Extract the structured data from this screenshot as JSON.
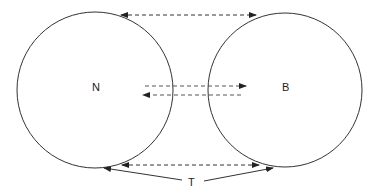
{
  "diagram": {
    "nodes": [
      {
        "id": "N",
        "label": "N",
        "cx": 95,
        "cy": 90,
        "r": 78
      },
      {
        "id": "B",
        "label": "B",
        "cx": 285,
        "cy": 90,
        "r": 77
      }
    ],
    "annotation": {
      "label": "T"
    },
    "arrows": [
      {
        "type": "dashed-bidirectional",
        "position": "top"
      },
      {
        "type": "dashed",
        "direction": "N-to-B",
        "position": "middle-upper"
      },
      {
        "type": "dashed",
        "direction": "B-to-N",
        "position": "middle-lower"
      },
      {
        "type": "dashed-bidirectional",
        "position": "bottom"
      },
      {
        "type": "solid",
        "from": "T",
        "to": "N-tangent"
      },
      {
        "type": "solid",
        "from": "T",
        "to": "B-tangent"
      }
    ],
    "colors": {
      "stroke": "#333333",
      "dash_middle": "#555555"
    }
  }
}
